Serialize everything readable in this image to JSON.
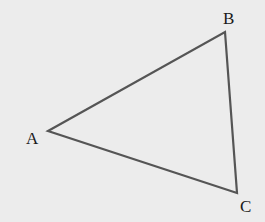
{
  "diagram": {
    "type": "triangle",
    "background": "#ececec",
    "stroke_color": "#555555",
    "vertices": [
      {
        "label": "A",
        "x": 48,
        "y": 131
      },
      {
        "label": "B",
        "x": 225,
        "y": 32
      },
      {
        "label": "C",
        "x": 237,
        "y": 193
      }
    ]
  }
}
